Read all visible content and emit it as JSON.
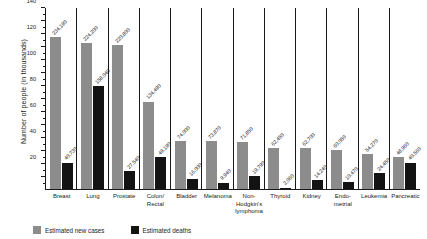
{
  "chart_data": {
    "type": "bar",
    "title": "",
    "xlabel": "",
    "ylabel": "Number of people (in thousands)",
    "ylim": [
      0,
      280
    ],
    "ytick_step": 20,
    "grid": false,
    "legend_position": "bottom-left",
    "categories": [
      "Breast",
      "Lung",
      "Prostate",
      "Colon/\nRectal",
      "Bladder",
      "Melanoma",
      "Non-\nHodgkin's\nlymphoma",
      "Thyroid",
      "Kidney",
      "Endo-\nmetrial",
      "Leukemia",
      "Pancreatic"
    ],
    "ytick_labels": [
      "20",
      "40",
      "60",
      "80",
      "100",
      "120",
      "140",
      "160",
      "180",
      "200",
      "220",
      "240",
      "260",
      "280"
    ],
    "series": [
      {
        "name": "Estimated new cases",
        "color": "#8c8c8c",
        "values": [
          234190,
          224200,
          220800,
          134490,
          74000,
          73870,
          71850,
          62450,
          62700,
          60050,
          54270,
          48960
        ],
        "labels": [
          "234,190",
          "224,200",
          "220,800",
          "134,490",
          "74,000",
          "73,870",
          "71,850",
          "62,450",
          "62,700",
          "60,050",
          "54,270",
          "48,960"
        ]
      },
      {
        "name": "Estimated deaths",
        "color": "#131313",
        "values": [
          40730,
          158040,
          27540,
          49190,
          16000,
          9940,
          19790,
          2060,
          14240,
          10470,
          24450,
          40560
        ],
        "labels": [
          "40,730",
          "158,040",
          "27,540",
          "49,190",
          "16,000",
          "9,940",
          "19,790",
          "2,060",
          "14,240",
          "10,470",
          "24,450",
          "40,560"
        ]
      }
    ]
  },
  "legend": {
    "cases_label": "Estimated new cases",
    "deaths_label": "Estimated deaths"
  }
}
